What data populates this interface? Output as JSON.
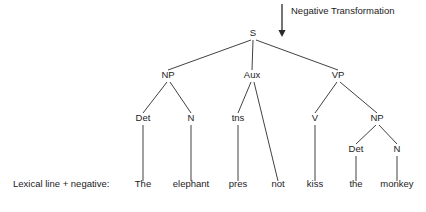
{
  "diagram": {
    "title_annotation": {
      "label": "Negative Transformation",
      "arrow_icon": "arrow-down-icon",
      "arrow_x": 282,
      "arrow_y_start": 4,
      "arrow_y_end": 37,
      "label_x": 291,
      "label_y": 14
    },
    "row_caption": {
      "text": "Lexical line + negative:",
      "x": 13,
      "y": 187
    },
    "line_color": "#2b2b2b",
    "text_color": "#1c1c1c",
    "background_color": "#ffffff",
    "nodes": [
      {
        "id": "S",
        "label": "S",
        "x": 253,
        "y": 36,
        "level": 0
      },
      {
        "id": "NP1",
        "label": "NP",
        "x": 168,
        "y": 78,
        "level": 1
      },
      {
        "id": "Aux",
        "label": "Aux",
        "x": 252,
        "y": 78,
        "level": 1
      },
      {
        "id": "VP",
        "label": "VP",
        "x": 338,
        "y": 78,
        "level": 1
      },
      {
        "id": "Det1",
        "label": "Det",
        "x": 143,
        "y": 121,
        "level": 2
      },
      {
        "id": "N1",
        "label": "N",
        "x": 191,
        "y": 121,
        "level": 2
      },
      {
        "id": "tns",
        "label": "tns",
        "x": 238,
        "y": 121,
        "level": 2
      },
      {
        "id": "V",
        "label": "V",
        "x": 315,
        "y": 121,
        "level": 2
      },
      {
        "id": "NP2",
        "label": "NP",
        "x": 377,
        "y": 121,
        "level": 2
      },
      {
        "id": "Det2",
        "label": "Det",
        "x": 356,
        "y": 152,
        "level": 3
      },
      {
        "id": "N2",
        "label": "N",
        "x": 397,
        "y": 152,
        "level": 3
      }
    ],
    "leaves": [
      {
        "id": "w-the1",
        "label": "The",
        "x": 143,
        "y": 187,
        "parent": "Det1"
      },
      {
        "id": "w-elephant",
        "label": "elephant",
        "x": 191,
        "y": 187,
        "parent": "N1"
      },
      {
        "id": "w-pres",
        "label": "pres",
        "x": 238,
        "y": 187,
        "parent": "tns"
      },
      {
        "id": "w-not",
        "label": "not",
        "x": 278,
        "y": 187,
        "parent": "Aux"
      },
      {
        "id": "w-kiss",
        "label": "kiss",
        "x": 315,
        "y": 187,
        "parent": "V"
      },
      {
        "id": "w-the2",
        "label": "the",
        "x": 356,
        "y": 187,
        "parent": "Det2"
      },
      {
        "id": "w-monkey",
        "label": "monkey",
        "x": 397,
        "y": 187,
        "parent": "N2"
      }
    ],
    "edges": [
      {
        "from": "S",
        "to": "NP1",
        "x1": 251,
        "y1": 40,
        "x2": 168,
        "y2": 70
      },
      {
        "from": "S",
        "to": "Aux",
        "x1": 253,
        "y1": 40,
        "x2": 252,
        "y2": 70
      },
      {
        "from": "S",
        "to": "VP",
        "x1": 256,
        "y1": 40,
        "x2": 338,
        "y2": 70
      },
      {
        "from": "NP1",
        "to": "Det1",
        "x1": 167,
        "y1": 82,
        "x2": 143,
        "y2": 113
      },
      {
        "from": "NP1",
        "to": "N1",
        "x1": 170,
        "y1": 82,
        "x2": 191,
        "y2": 113
      },
      {
        "from": "Aux",
        "to": "tns",
        "x1": 251,
        "y1": 82,
        "x2": 238,
        "y2": 113
      },
      {
        "from": "Aux",
        "to": "not",
        "x1": 254,
        "y1": 82,
        "x2": 278,
        "y2": 181
      },
      {
        "from": "VP",
        "to": "V",
        "x1": 337,
        "y1": 82,
        "x2": 315,
        "y2": 113
      },
      {
        "from": "VP",
        "to": "NP2",
        "x1": 340,
        "y1": 82,
        "x2": 377,
        "y2": 113
      },
      {
        "from": "NP2",
        "to": "Det2",
        "x1": 376,
        "y1": 125,
        "x2": 356,
        "y2": 144
      },
      {
        "from": "NP2",
        "to": "N2",
        "x1": 379,
        "y1": 125,
        "x2": 397,
        "y2": 144
      },
      {
        "from": "Det1",
        "to": "w-the1",
        "x1": 143,
        "y1": 125,
        "x2": 143,
        "y2": 181
      },
      {
        "from": "N1",
        "to": "w-elephant",
        "x1": 191,
        "y1": 125,
        "x2": 191,
        "y2": 181
      },
      {
        "from": "tns",
        "to": "w-pres",
        "x1": 238,
        "y1": 125,
        "x2": 238,
        "y2": 181
      },
      {
        "from": "V",
        "to": "w-kiss",
        "x1": 315,
        "y1": 125,
        "x2": 315,
        "y2": 181
      },
      {
        "from": "Det2",
        "to": "w-the2",
        "x1": 356,
        "y1": 156,
        "x2": 356,
        "y2": 181
      },
      {
        "from": "N2",
        "to": "w-monkey",
        "x1": 397,
        "y1": 156,
        "x2": 397,
        "y2": 181
      }
    ]
  }
}
